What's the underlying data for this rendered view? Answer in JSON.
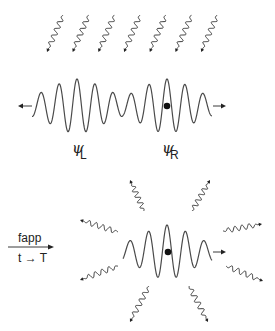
{
  "labels": {
    "psi_left_symbol": "ψ",
    "psi_left_sub": "L",
    "psi_right_symbol": "ψ",
    "psi_right_sub": "R",
    "process_label": "fapp",
    "process_sublabel": "t → T"
  },
  "top_panel": {
    "incoming_photon_count": 7,
    "incoming_photon_direction": "down-left",
    "wave_packets": [
      "psi_L",
      "psi_R"
    ],
    "particle_location": "psi_R",
    "arrows": [
      "left",
      "right"
    ]
  },
  "bottom_panel": {
    "wave_packets": [
      "psi_R"
    ],
    "particle_location": "center",
    "emitted_photon_count": 8,
    "emitted_photon_direction": "radial-outward",
    "arrows": [
      "right"
    ]
  },
  "colors": {
    "line": "#4a4a4a",
    "photon": "#3a3a3a",
    "dot": "#111111",
    "background": "#ffffff"
  }
}
